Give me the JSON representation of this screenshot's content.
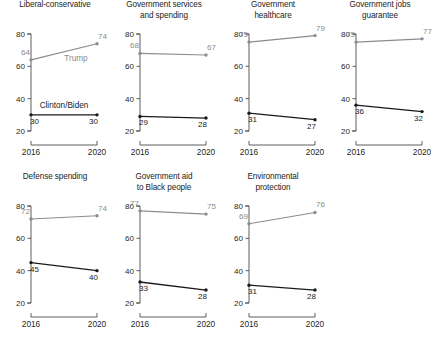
{
  "chart_data": {
    "type": "line",
    "title": "",
    "xlabel": "",
    "ylabel": "",
    "x": [
      "2016",
      "2020"
    ],
    "xtick_labels": [
      "2016",
      "2020"
    ],
    "ytick_labels": [
      "20",
      "40",
      "60",
      "80"
    ],
    "ylim": [
      20,
      80
    ],
    "yticks": [
      20,
      40,
      60,
      80
    ],
    "grid": false,
    "legend_position": "inline-annotation",
    "legend_entries": [
      "Trump",
      "Clinton/Biden"
    ],
    "series_colors": {
      "Trump": "#8c8c8c",
      "Clinton/Biden": "#1a1a1a"
    },
    "panels": [
      {
        "title": "Liberal-conservative",
        "title_lines": "Liberal-conservative",
        "series": [
          {
            "name": "Trump",
            "values": [
              64,
              74
            ],
            "labels": [
              "64",
              "74"
            ]
          },
          {
            "name": "Clinton/Biden",
            "values": [
              30,
              30
            ],
            "labels": [
              "30",
              "30"
            ]
          }
        ],
        "annotations": [
          {
            "text": "Trump",
            "series": "Trump"
          },
          {
            "text": "Clinton/Biden",
            "series": "Clinton/Biden"
          }
        ]
      },
      {
        "title": "Government services and spending",
        "title_lines": "Government services\nand spending",
        "series": [
          {
            "name": "Trump",
            "values": [
              68,
              67
            ],
            "labels": [
              "68",
              "67"
            ]
          },
          {
            "name": "Clinton/Biden",
            "values": [
              29,
              28
            ],
            "labels": [
              "29",
              "28"
            ]
          }
        ],
        "annotations": []
      },
      {
        "title": "Government healthcare",
        "title_lines": "Government\nhealthcare",
        "series": [
          {
            "name": "Trump",
            "values": [
              75,
              79
            ],
            "labels": [
              "75",
              "79"
            ]
          },
          {
            "name": "Clinton/Biden",
            "values": [
              31,
              27
            ],
            "labels": [
              "31",
              "27"
            ]
          }
        ],
        "annotations": []
      },
      {
        "title": "Government jobs guarantee",
        "title_lines": "Government jobs\nguarantee",
        "series": [
          {
            "name": "Trump",
            "values": [
              75,
              77
            ],
            "labels": [
              "75",
              "77"
            ]
          },
          {
            "name": "Clinton/Biden",
            "values": [
              36,
              32
            ],
            "labels": [
              "36",
              "32"
            ]
          }
        ],
        "annotations": []
      },
      {
        "title": "Defense spending",
        "title_lines": "Defense spending",
        "series": [
          {
            "name": "Trump",
            "values": [
              72,
              74
            ],
            "labels": [
              "72",
              "74"
            ]
          },
          {
            "name": "Clinton/Biden",
            "values": [
              45,
              40
            ],
            "labels": [
              "45",
              "40"
            ]
          }
        ],
        "annotations": []
      },
      {
        "title": "Government aid to Black people",
        "title_lines": "Government aid\nto Black people",
        "series": [
          {
            "name": "Trump",
            "values": [
              77,
              75
            ],
            "labels": [
              "77",
              "75"
            ]
          },
          {
            "name": "Clinton/Biden",
            "values": [
              33,
              28
            ],
            "labels": [
              "33",
              "28"
            ]
          }
        ],
        "annotations": []
      },
      {
        "title": "Environmental protection",
        "title_lines": "Environmental\nprotection",
        "series": [
          {
            "name": "Trump",
            "values": [
              69,
              76
            ],
            "labels": [
              "69",
              "76"
            ]
          },
          {
            "name": "Clinton/Biden",
            "values": [
              31,
              28
            ],
            "labels": [
              "31",
              "28"
            ]
          }
        ],
        "annotations": []
      }
    ]
  }
}
